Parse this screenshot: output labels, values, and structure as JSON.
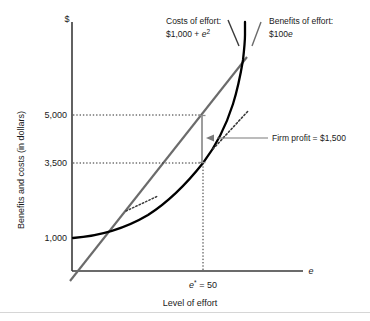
{
  "figure": {
    "axes": {
      "y_top_symbol": "$",
      "y_axis_title": "Benefits and costs (in dollars)",
      "x_end_symbol": "e",
      "x_axis_title": "Level of effort",
      "y_ticks": [
        "5,000",
        "3,500",
        "1,000"
      ],
      "x_tick": "e* = 50"
    },
    "annotations": {
      "costs_label_line1": "Costs of effort:",
      "costs_label_line2_pre": "$1,000 + ",
      "costs_label_line2_var": "e",
      "costs_label_line2_sup": "2",
      "benefits_label_line1": "Benefits of effort:",
      "benefits_label_line2_pre": "$100",
      "benefits_label_line2_var": "e",
      "profit_label": "Firm profit = $1,500"
    },
    "colors": {
      "benefits_line": "#6b6b6b",
      "costs_curve": "#000000",
      "axis": "#3a3a3a",
      "gridline": "#2b2b2b",
      "profit_bar": "#8c8c8c",
      "leader": "#7a7a7a",
      "text": "#1a1a1a"
    }
  },
  "chart_data": {
    "type": "line",
    "title": "",
    "xlabel": "Level of effort",
    "ylabel": "Benefits and costs (in dollars)",
    "xlim": [
      0,
      70
    ],
    "ylim": [
      0,
      6500
    ],
    "grid": false,
    "legend_position": "inline-annotations",
    "y_tick_values": [
      5000,
      3500,
      1000
    ],
    "y_tick_labels": [
      "5,000",
      "3,500",
      "1,000"
    ],
    "x_tick_values": [
      50
    ],
    "x_tick_labels": [
      "e* = 50"
    ],
    "series": [
      {
        "name": "Benefits of effort: $100e",
        "type": "line",
        "color": "#6b6b6b",
        "equation": "B(e) = 100e",
        "x": [
          0,
          10,
          20,
          30,
          40,
          50,
          60,
          63
        ],
        "values": [
          0,
          1000,
          2000,
          3000,
          4000,
          5000,
          6000,
          6300
        ]
      },
      {
        "name": "Costs of effort: $1,000 + e^2",
        "type": "curve",
        "color": "#000000",
        "equation": "C(e) = 1000 + e^2",
        "x": [
          0,
          10,
          20,
          30,
          40,
          50,
          60,
          70
        ],
        "values": [
          1000,
          1100,
          1400,
          1900,
          2600,
          3500,
          4600,
          5900
        ]
      }
    ],
    "annotations": [
      {
        "text": "Costs of effort: $1,000 + e²",
        "at_x": 22,
        "at_y": 6200
      },
      {
        "text": "Benefits of effort: $100e",
        "at_x": 52,
        "at_y": 6200
      },
      {
        "text": "Firm profit = $1,500",
        "at_x": 50,
        "at_y": 4250,
        "value": 1500,
        "from_y": 3500,
        "to_y": 5000
      },
      {
        "text": "e* = 50",
        "at_x": 50,
        "at_y": 0
      }
    ],
    "optimum": {
      "e_star": 50,
      "benefits": 5000,
      "costs": 3500,
      "profit": 1500
    },
    "tangent_segments": [
      {
        "note": "slope 100 tangent near low effort",
        "x_center": 22
      },
      {
        "note": "slope 100 tangent at optimum",
        "x_center": 52
      }
    ]
  }
}
